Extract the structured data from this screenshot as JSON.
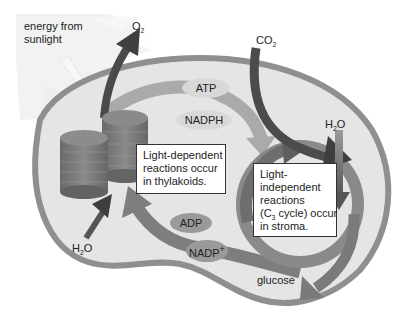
{
  "diagram": {
    "labels": {
      "sunlight_line1": "energy from",
      "sunlight_line2": "sunlight",
      "o2_main": "O",
      "o2_sub": "2",
      "co2_main": "CO",
      "co2_sub": "2",
      "h2o_right_pre": "H",
      "h2o_right_sub": "2",
      "h2o_right_post": "O",
      "h2o_left_pre": "H",
      "h2o_left_sub": "2",
      "h2o_left_post": "O",
      "glucose": "glucose"
    },
    "molecules": {
      "atp": "ATP",
      "nadph": "NADPH",
      "adp": "ADP",
      "nadp_main": "NADP",
      "nadp_sup": "+"
    },
    "boxes": {
      "light_dependent": {
        "lines": [
          "Light-dependent",
          "reactions occur",
          "in thylakoids."
        ]
      },
      "light_independent": {
        "line1": "Light-",
        "line2": "independent",
        "line3": "reactions",
        "line4_pre": "(C",
        "line4_sub": "3",
        "line4_post": " cycle) occur",
        "line5": "in stroma."
      }
    },
    "colors": {
      "background": "#ffffff",
      "chloroplast_fill": "#e4e4e4",
      "chloroplast_border": "#8e8e8e",
      "thylakoid": "#7a7a7a",
      "thylakoid_top": "#8c8c8c",
      "dark_arrow": "#4a4a4a",
      "mid_arrow": "#7e7e7e",
      "light_arrow": "#a9a9a9",
      "pill_light": "#d6d6d6",
      "pill_dark": "#9a9a9a",
      "sun": "#f1f1f1"
    }
  }
}
